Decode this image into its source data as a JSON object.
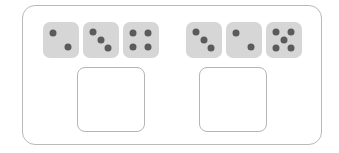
{
  "worksheet": {
    "type": "dice-addition-worksheet",
    "panel_border_color": "#b9b9b9",
    "background_color": "#ffffff",
    "die_face_color": "#d6d6d6",
    "pip_color": "#5b5b5b",
    "answer_box_border_color": "#b5b5b5"
  },
  "problems": [
    {
      "id": "problem-1",
      "dice": [
        {
          "name": "die-1",
          "value": 2,
          "pips": [
            [
              30,
              30
            ],
            [
              70,
              70
            ]
          ]
        },
        {
          "name": "die-2",
          "value": 3,
          "pips": [
            [
              28,
              27
            ],
            [
              50,
              50
            ],
            [
              72,
              73
            ]
          ]
        },
        {
          "name": "die-3",
          "value": 4,
          "pips": [
            [
              30,
              30
            ],
            [
              70,
              30
            ],
            [
              30,
              70
            ],
            [
              70,
              70
            ]
          ]
        }
      ],
      "answer_box": {
        "name": "answer-box-1",
        "value": ""
      }
    },
    {
      "id": "problem-2",
      "dice": [
        {
          "name": "die-4",
          "value": 3,
          "pips": [
            [
              28,
              27
            ],
            [
              50,
              50
            ],
            [
              72,
              73
            ]
          ]
        },
        {
          "name": "die-5",
          "value": 2,
          "pips": [
            [
              30,
              30
            ],
            [
              70,
              70
            ]
          ]
        },
        {
          "name": "die-6",
          "value": 5,
          "pips": [
            [
              28,
              28
            ],
            [
              72,
              28
            ],
            [
              50,
              50
            ],
            [
              28,
              72
            ],
            [
              72,
              72
            ]
          ]
        }
      ],
      "answer_box": {
        "name": "answer-box-2",
        "value": ""
      }
    }
  ]
}
